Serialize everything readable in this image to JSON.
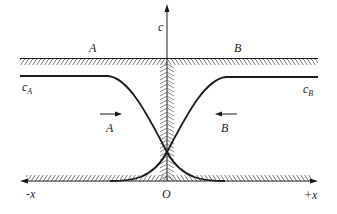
{
  "diagram": {
    "axis_y_label": "c",
    "axis_x_neg_label": "-x",
    "axis_x_pos_label": "+x",
    "origin_label": "O",
    "region_left_label": "A",
    "region_right_label": "B",
    "conc_left_label": "c",
    "conc_left_sub": "A",
    "conc_right_label": "c",
    "conc_right_sub": "B",
    "flux_left_label": "A",
    "flux_right_label": "B",
    "colors": {
      "line": "#1a1a1a",
      "hatch": "#555555"
    }
  }
}
